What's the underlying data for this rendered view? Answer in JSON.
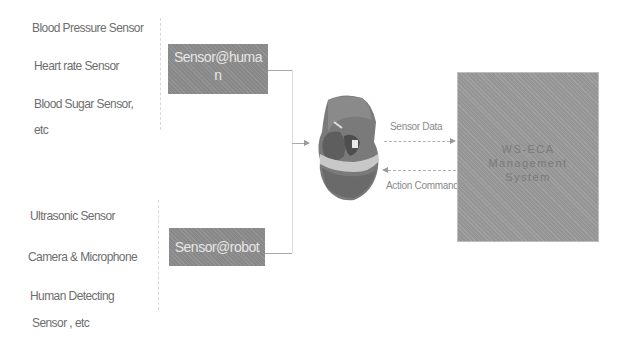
{
  "human_sensors": {
    "items": [
      "Blood Pressure  Sensor",
      "Heart rate   Sensor",
      "Blood Sugar Sensor,",
      "etc"
    ]
  },
  "robot_sensors": {
    "items": [
      "Ultrasonic  Sensor",
      "Camera & Microphone",
      "Human  Detecting",
      "Sensor     , etc"
    ]
  },
  "boxes": {
    "sensor_human": {
      "line1": "Sensor@huma",
      "line2": "n"
    },
    "sensor_robot": {
      "label": "Sensor@robot"
    },
    "management": {
      "line1": "WS-ECA",
      "line2": "Management",
      "line3": "System"
    }
  },
  "arrows": {
    "sensor_data": "Sensor Data",
    "action_command": "Action Command"
  },
  "colors": {
    "box_fill": "#8e8e8e",
    "management_fill": "#9b9b9b",
    "text": "#6e6e6e"
  }
}
